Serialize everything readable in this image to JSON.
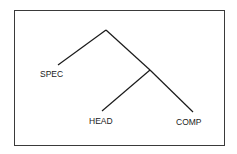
{
  "diagram": {
    "type": "syntax-tree",
    "nodes": [
      {
        "id": "root",
        "label": ""
      },
      {
        "id": "bar",
        "label": ""
      },
      {
        "id": "spec",
        "label": "SPEC"
      },
      {
        "id": "head",
        "label": "HEAD"
      },
      {
        "id": "comp",
        "label": "COMP"
      }
    ],
    "edges": [
      [
        "root",
        "spec"
      ],
      [
        "root",
        "bar"
      ],
      [
        "bar",
        "head"
      ],
      [
        "bar",
        "comp"
      ]
    ]
  },
  "labels": {
    "spec": "SPEC",
    "head": "HEAD",
    "comp": "COMP"
  }
}
